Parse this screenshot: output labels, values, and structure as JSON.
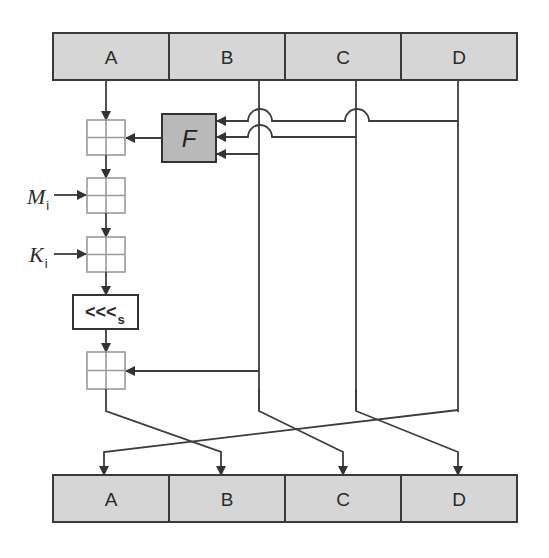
{
  "diagram": {
    "type": "MD5 compression function single step",
    "top_register": {
      "cells": [
        {
          "label": "A"
        },
        {
          "label": "B"
        },
        {
          "label": "C"
        },
        {
          "label": "D"
        }
      ]
    },
    "bottom_register": {
      "cells": [
        {
          "label": "A"
        },
        {
          "label": "B"
        },
        {
          "label": "C"
        },
        {
          "label": "D"
        }
      ]
    },
    "function_box": {
      "label": "F"
    },
    "inputs": {
      "message": {
        "label": "M",
        "subscript": "i"
      },
      "constant": {
        "label": "K",
        "subscript": "i"
      }
    },
    "rotate": {
      "label": "<<<",
      "subscript": "s"
    },
    "adders": [
      {
        "name": "add-f-output"
      },
      {
        "name": "add-message"
      },
      {
        "name": "add-constant"
      },
      {
        "name": "add-b"
      }
    ],
    "edges": [
      {
        "from": "A",
        "to": "add-f-output"
      },
      {
        "from": "B",
        "to": "F"
      },
      {
        "from": "C",
        "to": "F"
      },
      {
        "from": "D",
        "to": "F"
      },
      {
        "from": "F",
        "to": "add-f-output"
      },
      {
        "from": "add-f-output",
        "to": "add-message"
      },
      {
        "from": "M_i",
        "to": "add-message"
      },
      {
        "from": "add-message",
        "to": "add-constant"
      },
      {
        "from": "K_i",
        "to": "add-constant"
      },
      {
        "from": "add-constant",
        "to": "rotate"
      },
      {
        "from": "rotate",
        "to": "add-b"
      },
      {
        "from": "B",
        "to": "add-b"
      },
      {
        "from": "add-b",
        "to": "out-B"
      },
      {
        "from": "B",
        "to": "out-C"
      },
      {
        "from": "C",
        "to": "out-D"
      },
      {
        "from": "D",
        "to": "out-A"
      }
    ],
    "colors": {
      "register_fill": "#d6d6d6",
      "function_fill": "#b9b9b9",
      "line": "#3d3d3d",
      "adder_stroke": "#9a9a9a"
    }
  }
}
